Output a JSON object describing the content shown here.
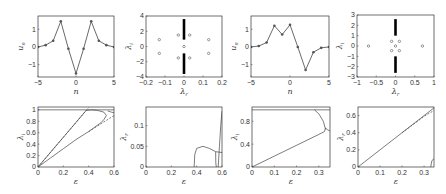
{
  "figure": {
    "width": 446,
    "height": 194,
    "line_color": "#444444",
    "marker_color": "#555555",
    "axis_color": "#333333"
  },
  "chart_data": [
    {
      "id": "p1",
      "type": "line",
      "title": "",
      "box": [
        38,
        16,
        114,
        77
      ],
      "xlabel": "n",
      "ylabel": "u",
      "ylabel_sub": "n",
      "xlim": [
        -5,
        5
      ],
      "ylim": [
        -1.7,
        1.75
      ],
      "xticks": [
        -5,
        0,
        5
      ],
      "yticks": [
        -1,
        0,
        1
      ],
      "x": [
        -5,
        -4,
        -3,
        -2,
        -1,
        0,
        1,
        2,
        3,
        4,
        5
      ],
      "y": [
        0.0,
        0.1,
        0.35,
        1.45,
        -0.1,
        -1.5,
        -0.1,
        1.45,
        0.35,
        0.1,
        0.0
      ],
      "markers": true
    },
    {
      "id": "p2",
      "type": "scatter",
      "title": "",
      "box": [
        146,
        16,
        222,
        77
      ],
      "xlabel": "λ",
      "xlabel_sub": "r",
      "ylabel": "λ",
      "ylabel_sub": "i",
      "xlim": [
        -0.2,
        0.2
      ],
      "ylim": [
        -4,
        4
      ],
      "xticks": [
        -0.2,
        -0.1,
        0,
        0.1,
        0.2
      ],
      "yticks": [
        -4,
        -2,
        0,
        2,
        4
      ],
      "points": [
        [
          -0.13,
          0.9
        ],
        [
          -0.13,
          -0.9
        ],
        [
          0.13,
          0.9
        ],
        [
          0.13,
          -0.9
        ],
        [
          -0.03,
          1.5
        ],
        [
          0.03,
          1.5
        ],
        [
          -0.03,
          -1.5
        ],
        [
          0.03,
          -1.5
        ],
        [
          0,
          0
        ]
      ],
      "bands": [
        [
          0,
          0.9,
          3.6
        ],
        [
          0,
          -3.6,
          -0.9
        ]
      ]
    },
    {
      "id": "p3",
      "type": "line",
      "title": "",
      "box": [
        251,
        16,
        329,
        77
      ],
      "xlabel": "n",
      "ylabel": "u",
      "ylabel_sub": "n",
      "xlim": [
        -5,
        5
      ],
      "ylim": [
        -1.7,
        1.75
      ],
      "xticks": [
        -5,
        0,
        5
      ],
      "yticks": [
        -1,
        0,
        1
      ],
      "x": [
        -5,
        -4,
        -3,
        -2,
        -1,
        0,
        1,
        2,
        3,
        4,
        5
      ],
      "y": [
        0.0,
        0.05,
        0.25,
        1.2,
        0.7,
        1.25,
        0.0,
        -1.3,
        -0.3,
        -0.05,
        0.0
      ],
      "markers": true
    },
    {
      "id": "p4",
      "type": "scatter",
      "title": "",
      "box": [
        357,
        15,
        434,
        77
      ],
      "xlabel": "λ",
      "xlabel_sub": "r",
      "ylabel": "λ",
      "ylabel_sub": "i",
      "xlim": [
        -1,
        1
      ],
      "ylim": [
        -3,
        3
      ],
      "xticks": [
        -1,
        -0.5,
        0,
        0.5,
        1
      ],
      "yticks": [
        -3,
        -2,
        -1,
        0,
        1,
        2,
        3
      ],
      "points": [
        [
          -0.7,
          0
        ],
        [
          0.7,
          0
        ],
        [
          -0.1,
          0.45
        ],
        [
          0.1,
          0.45
        ],
        [
          -0.1,
          -0.45
        ],
        [
          0.1,
          -0.45
        ],
        [
          0,
          0
        ]
      ],
      "bands": [
        [
          0,
          1.0,
          2.6
        ],
        [
          0,
          -2.6,
          -1.0
        ]
      ]
    },
    {
      "id": "p5",
      "type": "line",
      "title": "",
      "box": [
        38,
        107,
        114,
        167
      ],
      "xlabel": "ε",
      "ylabel": "λ",
      "ylabel_sub": "i",
      "xlim": [
        0,
        0.6
      ],
      "ylim": [
        0,
        1.05
      ],
      "xticks": [
        0,
        0.2,
        0.4,
        0.6
      ],
      "yticks": [
        0,
        0.2,
        0.4,
        0.6,
        0.8,
        1
      ],
      "series": [
        {
          "name": "upper branch",
          "style": "solid",
          "x": [
            0,
            0.1,
            0.2,
            0.3,
            0.38
          ],
          "y": [
            0,
            0.26,
            0.52,
            0.78,
            0.99
          ]
        },
        {
          "name": "upper asymptote",
          "style": "dashed",
          "x": [
            0,
            0.2,
            0.4
          ],
          "y": [
            0,
            0.52,
            1.04
          ]
        },
        {
          "name": "top curve",
          "style": "solid",
          "x": [
            0.38,
            0.42,
            0.47,
            0.52,
            0.54,
            0.52,
            0.5
          ],
          "y": [
            0.99,
            1.0,
            0.99,
            0.96,
            0.9,
            0.83,
            0.78
          ]
        },
        {
          "name": "lower branch",
          "style": "solid",
          "x": [
            0,
            0.1,
            0.2,
            0.3,
            0.4,
            0.5
          ],
          "y": [
            0,
            0.16,
            0.32,
            0.48,
            0.62,
            0.78
          ]
        },
        {
          "name": "lower asymptote",
          "style": "dashed",
          "x": [
            0.4,
            0.5,
            0.6
          ],
          "y": [
            0.62,
            0.76,
            0.9
          ]
        },
        {
          "name": "right curve",
          "style": "solid",
          "x": [
            0.55,
            0.58,
            0.6
          ],
          "y": [
            0.98,
            0.96,
            0.95
          ]
        },
        {
          "name": "continuum edge",
          "style": "solid",
          "x": [
            0,
            0.6
          ],
          "y": [
            1.0,
            1.0
          ]
        }
      ]
    },
    {
      "id": "p6",
      "type": "line",
      "title": "",
      "box": [
        146,
        107,
        222,
        167
      ],
      "xlabel": "ε",
      "ylabel": "λ",
      "ylabel_sub": "r",
      "xlim": [
        0,
        0.6
      ],
      "ylim": [
        0,
        0.145
      ],
      "xticks": [
        0,
        0.2,
        0.4,
        0.6
      ],
      "yticks": [
        0,
        0.05,
        0.1
      ],
      "series": [
        {
          "name": "bubble",
          "style": "solid",
          "x": [
            0.38,
            0.385,
            0.4,
            0.45,
            0.5,
            0.55,
            0.6
          ],
          "y": [
            0,
            0.03,
            0.045,
            0.05,
            0.045,
            0.037,
            0.035
          ]
        },
        {
          "name": "drop",
          "style": "solid",
          "x": [
            0.55,
            0.551,
            0.555
          ],
          "y": [
            0.037,
            0.01,
            0
          ]
        },
        {
          "name": "steep rise",
          "style": "solid",
          "x": [
            0.57,
            0.58,
            0.59,
            0.6
          ],
          "y": [
            0,
            0.05,
            0.1,
            0.135
          ]
        }
      ]
    },
    {
      "id": "p7",
      "type": "line",
      "title": "",
      "box": [
        252,
        107,
        330,
        167
      ],
      "xlabel": "ε",
      "ylabel": "λ",
      "ylabel_sub": "i",
      "xlim": [
        0,
        0.35
      ],
      "ylim": [
        0,
        1.05
      ],
      "xticks": [
        0,
        0.1,
        0.2,
        0.3
      ],
      "yticks": [
        0,
        0.4,
        0.8
      ],
      "series": [
        {
          "name": "linear branch",
          "style": "solid",
          "x": [
            0,
            0.1,
            0.2,
            0.3,
            0.325
          ],
          "y": [
            0,
            0.19,
            0.38,
            0.57,
            0.62
          ]
        },
        {
          "name": "descending curve",
          "style": "solid",
          "x": [
            0.28,
            0.3,
            0.32,
            0.33
          ],
          "y": [
            1.0,
            0.93,
            0.8,
            0.66
          ]
        },
        {
          "name": "loop",
          "style": "solid",
          "x": [
            0.325,
            0.33,
            0.34,
            0.35
          ],
          "y": [
            0.62,
            0.68,
            0.65,
            0.63
          ]
        },
        {
          "name": "continuum edge",
          "style": "solid",
          "x": [
            0,
            0.35
          ],
          "y": [
            1.0,
            1.0
          ]
        }
      ]
    },
    {
      "id": "p8",
      "type": "line",
      "title": "",
      "box": [
        358,
        107,
        434,
        167
      ],
      "xlabel": "ε",
      "ylabel": "λ",
      "ylabel_sub": "r",
      "xlim": [
        0,
        0.345
      ],
      "ylim": [
        0,
        0.7
      ],
      "xticks": [
        0,
        0.1,
        0.2,
        0.3
      ],
      "yticks": [
        0,
        0.2,
        0.4,
        0.6
      ],
      "series": [
        {
          "name": "linear",
          "style": "solid",
          "x": [
            0,
            0.1,
            0.2,
            0.3,
            0.345
          ],
          "y": [
            0,
            0.2,
            0.4,
            0.6,
            0.69
          ]
        },
        {
          "name": "asymptote",
          "style": "dashed",
          "x": [
            0.2,
            0.3,
            0.345
          ],
          "y": [
            0.4,
            0.59,
            0.66
          ]
        },
        {
          "name": "small rise",
          "style": "solid",
          "x": [
            0.33,
            0.335,
            0.345
          ],
          "y": [
            0,
            0.07,
            0.1
          ]
        }
      ]
    }
  ]
}
